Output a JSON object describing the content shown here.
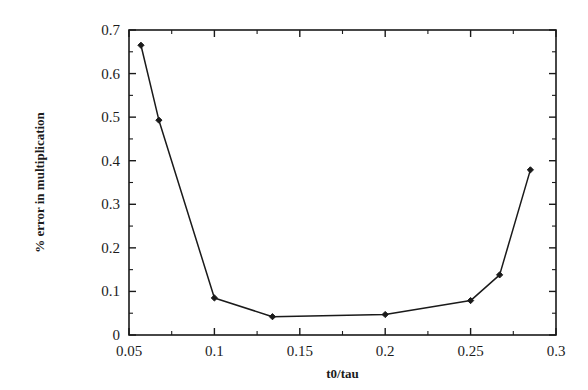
{
  "chart_data": {
    "type": "line",
    "title": "",
    "subtitle": "",
    "xlabel": "t0/tau",
    "ylabel": "% error in multiplication",
    "xlim": [
      0.05,
      0.3
    ],
    "ylim": [
      0,
      0.7
    ],
    "grid": false,
    "legend": null,
    "legend_position": "none",
    "marker": "filled-diamond",
    "line_color": "#1a1a1a",
    "marker_color": "#1a1a1a",
    "background_color": "#ffffff",
    "x_ticks": [
      0.05,
      0.1,
      0.15,
      0.2,
      0.25,
      0.3
    ],
    "x_tick_labels": [
      "0.05",
      "0.1",
      "0.15",
      "0.2",
      "0.25",
      "0.3"
    ],
    "x_minor_ticks": [
      0.075,
      0.125,
      0.175,
      0.225,
      0.275
    ],
    "y_ticks": [
      0,
      0.1,
      0.2,
      0.3,
      0.4,
      0.5,
      0.6,
      0.7
    ],
    "y_tick_labels": [
      "0",
      "0.1",
      "0.2",
      "0.3",
      "0.4",
      "0.5",
      "0.6",
      "0.7"
    ],
    "y_minor_ticks": [
      0.05,
      0.15,
      0.25,
      0.35,
      0.45,
      0.55,
      0.65
    ],
    "series": [
      {
        "name": "% error in multiplication",
        "x": [
          0.057,
          0.0675,
          0.1,
          0.134,
          0.2,
          0.25,
          0.267,
          0.285
        ],
        "values": [
          0.665,
          0.493,
          0.085,
          0.042,
          0.047,
          0.079,
          0.138,
          0.379
        ]
      }
    ]
  }
}
